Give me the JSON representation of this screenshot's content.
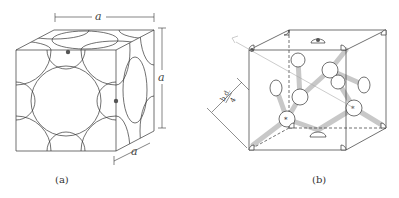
{
  "figure_a": {
    "caption": "(a)",
    "dim_top": "a",
    "dim_right": "a",
    "dim_bottom": "a"
  },
  "figure_b": {
    "caption": "(b)",
    "dim_label_top": "b.d.",
    "dim_label_bottom": "4"
  },
  "colors": {
    "line": "#333333",
    "bond": "#bbbbbb",
    "dot": "#555555"
  }
}
